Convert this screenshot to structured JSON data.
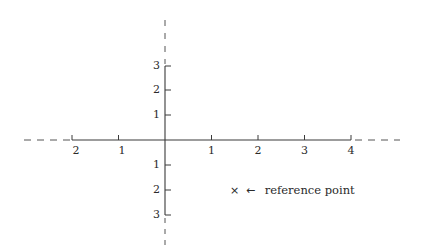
{
  "diagram": {
    "type": "coordinate-axes",
    "origin_px": [
      165,
      140
    ],
    "x_unit_px": 46.5,
    "y_unit_px": 25,
    "x_axis": {
      "ticks_negative": [
        {
          "value": 2,
          "label": "2"
        },
        {
          "value": 1,
          "label": "1"
        }
      ],
      "ticks_positive": [
        {
          "value": 1,
          "label": "1"
        },
        {
          "value": 2,
          "label": "2"
        },
        {
          "value": 3,
          "label": "3"
        },
        {
          "value": 4,
          "label": "4"
        }
      ]
    },
    "y_axis": {
      "ticks_positive": [
        {
          "value": 3,
          "label": "3"
        },
        {
          "value": 2,
          "label": "2"
        },
        {
          "value": 1,
          "label": "1"
        }
      ],
      "ticks_negative": [
        {
          "value": 1,
          "label": "1"
        },
        {
          "value": 2,
          "label": "2"
        },
        {
          "value": 3,
          "label": "3"
        }
      ]
    },
    "annotation": {
      "marker": "×",
      "arrow": "←",
      "text": "reference point",
      "position": [
        1.5,
        -2
      ]
    },
    "colors": {
      "axis": "#3a3a3a",
      "dashed": "#555555",
      "background": "#ffffff"
    }
  }
}
